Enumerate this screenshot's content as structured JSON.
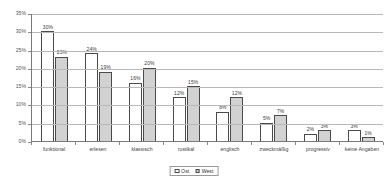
{
  "chart_data": {
    "type": "bar",
    "title": "",
    "subtitle": "",
    "xlabel": "",
    "ylabel": "",
    "ylim": [
      0,
      35
    ],
    "grid": true,
    "legend_position": "bottom",
    "value_suffix": "%",
    "categories": [
      "funktional",
      "erlesen",
      "klassisch",
      "rustikal",
      "englisch",
      "zweckmäßig",
      "progressiv",
      "keine Angaben"
    ],
    "series": [
      {
        "name": "Ost",
        "color": "#ffffff",
        "values": [
          30,
          24,
          16,
          12,
          8,
          5,
          2,
          3
        ],
        "labels": [
          "30%",
          "24%",
          "16%",
          "12%",
          "8%",
          "5%",
          "2%",
          "3%"
        ]
      },
      {
        "name": "West",
        "color": "#d2d2d2",
        "values": [
          23,
          19,
          20,
          15,
          12,
          7,
          3,
          1
        ],
        "labels": [
          "23%",
          "19%",
          "20%",
          "15%",
          "12%",
          "7%",
          "3%",
          "1%"
        ]
      }
    ],
    "yticks": [
      0,
      5,
      10,
      15,
      20,
      25,
      30,
      35
    ],
    "ytick_labels": [
      "0%",
      "5%",
      "10%",
      "15%",
      "20%",
      "25%",
      "30%",
      "35%"
    ]
  },
  "legend": {
    "items": [
      {
        "label": "Ost"
      },
      {
        "label": "West"
      }
    ]
  }
}
